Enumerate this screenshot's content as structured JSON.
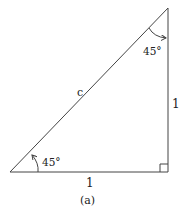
{
  "figure": {
    "caption": "(a)",
    "hypotenuse_label": "c",
    "vertical_side_label": "1",
    "horizontal_side_label": "1",
    "angle_bottom_left_label": "45°",
    "angle_top_label": "45°",
    "right_angle_marker": true,
    "line_color": "#444444",
    "text_color": "#222222"
  }
}
